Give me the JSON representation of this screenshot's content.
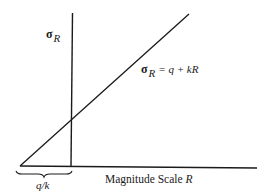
{
  "diagram": {
    "y_axis_label": {
      "symbol": "σ",
      "subscript": "R"
    },
    "line_equation": {
      "symbol": "σ",
      "subscript": "R",
      "rhs": "= q + kR"
    },
    "x_axis_label": {
      "text": "Magnitude Scale",
      "variable": "R"
    },
    "intercept_label": "q/k",
    "elements": [
      {
        "type": "line",
        "name": "horizontal-axis",
        "from": [
          20,
          166
        ],
        "to": [
          257,
          168
        ]
      },
      {
        "type": "line",
        "name": "vertical-axis",
        "from": [
          72,
          13
        ],
        "to": [
          71,
          166
        ]
      },
      {
        "type": "line",
        "name": "regression-line",
        "from": [
          20,
          166
        ],
        "to": [
          189,
          14
        ]
      },
      {
        "type": "brace",
        "name": "intercept-brace",
        "from": [
          16,
          172
        ],
        "to": [
          72,
          172
        ]
      }
    ],
    "colors": {
      "ink": "#1a1a1a",
      "background": "#ffffff"
    }
  }
}
